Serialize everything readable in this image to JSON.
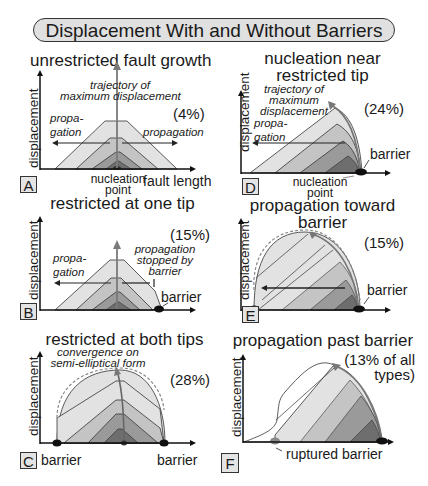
{
  "title": "Displacement With and Without Barriers",
  "axis": {
    "y_label": "displacement",
    "x_label": "fault length"
  },
  "panels": [
    {
      "id": "A",
      "title": "unrestricted fault growth",
      "percent": "(4%)",
      "labels": {
        "trajectory_1": "trajectory of",
        "trajectory_2": "maximum displacement",
        "prop_left_1": "propa-",
        "prop_left_2": "gation",
        "prop_right": "propagation",
        "nucleation_1": "nucleation",
        "nucleation_2": "point",
        "x_axis": "fault length"
      }
    },
    {
      "id": "B",
      "title": "restricted at one tip",
      "percent": "(15%)",
      "labels": {
        "prop_left_1": "propa-",
        "prop_left_2": "gation",
        "stopped_1": "propagation",
        "stopped_2": "stopped by",
        "stopped_3": "barrier",
        "barrier": "barrier"
      }
    },
    {
      "id": "C",
      "title": "restricted at both tips",
      "percent": "(28%)",
      "labels": {
        "convergence_1": "convergence on",
        "convergence_2": "semi-elliptical form",
        "barrier_left": "barrier",
        "barrier_right": "barrier"
      }
    },
    {
      "id": "D",
      "title_1": "nucleation near",
      "title_2": "restricted tip",
      "percent": "(24%)",
      "labels": {
        "trajectory_1": "trajectory of",
        "trajectory_2": "maximum",
        "trajectory_3": "displacement",
        "prop_left_1": "propa-",
        "prop_left_2": "gation",
        "barrier": "barrier",
        "nucleation_1": "nucleation",
        "nucleation_2": "point"
      }
    },
    {
      "id": "E",
      "title_1": "propagation toward",
      "title_2": "barrier",
      "percent": "(15%)",
      "labels": {
        "barrier": "barrier"
      }
    },
    {
      "id": "F",
      "title": "propagation past barrier",
      "percent_1": "(13% of all",
      "percent_2": "types)",
      "labels": {
        "ruptured": "ruptured barrier"
      }
    }
  ],
  "colors": {
    "shade_1": "#e2e2e2",
    "shade_2": "#c4c4c4",
    "shade_3": "#9a9a9a",
    "shade_4": "#6e6e6e",
    "outline": "#222222",
    "trajectory_arrow": "#7a7a7a",
    "barrier_dot": "#111111"
  }
}
